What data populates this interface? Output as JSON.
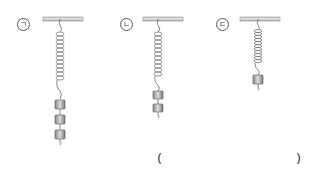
{
  "figure": {
    "type": "spring-weights-diagram",
    "springs": [
      {
        "label": "ㄱ",
        "weights": 3
      },
      {
        "label": "ㄴ",
        "weights": 2
      },
      {
        "label": "ㄷ",
        "weights": 1
      }
    ]
  },
  "answer": {
    "open_paren": "(",
    "close_paren": ")"
  }
}
